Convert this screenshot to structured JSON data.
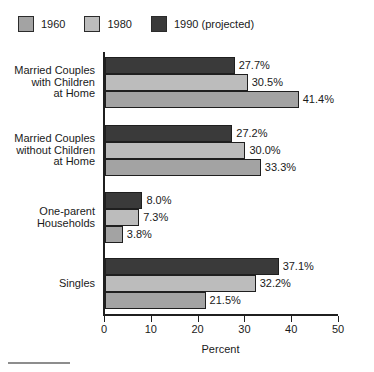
{
  "chart_data": {
    "type": "bar",
    "orientation": "horizontal",
    "title": "",
    "subtitle": "",
    "xlabel": "Percent",
    "ylabel": "",
    "xlim": [
      0,
      50
    ],
    "xticks": [
      0,
      10,
      20,
      30,
      40,
      50
    ],
    "xtick_labels": [
      "0",
      "10",
      "20",
      "30",
      "40",
      "50"
    ],
    "grid": false,
    "legend_position": "top-left",
    "value_label_suffix": "%",
    "categories": [
      "Married Couples\nwith Children\nat Home",
      "Married Couples\nwithout Children\nat Home",
      "One-parent\nHouseholds",
      "Singles"
    ],
    "series": [
      {
        "name": "1960",
        "color": "#a3a3a3",
        "values": [
          41.4,
          33.3,
          3.8,
          21.5
        ],
        "value_labels": [
          "41.4%",
          "33.3%",
          "3.8%",
          "21.5%"
        ]
      },
      {
        "name": "1980",
        "color": "#bcbcbc",
        "values": [
          30.5,
          30.0,
          7.3,
          32.2
        ],
        "value_labels": [
          "30.5%",
          "30.0%",
          "7.3%",
          "32.2%"
        ]
      },
      {
        "name": "1990 (projected)",
        "color": "#3a3a3a",
        "values": [
          27.7,
          27.2,
          8.0,
          37.1
        ],
        "value_labels": [
          "27.7%",
          "27.2%",
          "8.0%",
          "37.1%"
        ]
      }
    ]
  },
  "legend": {
    "entries": [
      {
        "label": "1960",
        "color": "#a3a3a3"
      },
      {
        "label": "1980",
        "color": "#bcbcbc"
      },
      {
        "label": "1990 (projected)",
        "color": "#3a3a3a"
      }
    ]
  },
  "axis": {
    "x_title": "Percent",
    "ticks": [
      "0",
      "10",
      "20",
      "30",
      "40",
      "50"
    ]
  },
  "categories": [
    {
      "label": "Married Couples\nwith Children\nat Home"
    },
    {
      "label": "Married Couples\nwithout Children\nat Home"
    },
    {
      "label": "One-parent\nHouseholds"
    },
    {
      "label": "Singles"
    }
  ],
  "bars": [
    {
      "category": 0,
      "series": "1990 (projected)",
      "value": 27.7,
      "label": "27.7%",
      "color": "#3a3a3a"
    },
    {
      "category": 0,
      "series": "1980",
      "value": 30.5,
      "label": "30.5%",
      "color": "#bcbcbc"
    },
    {
      "category": 0,
      "series": "1960",
      "value": 41.4,
      "label": "41.4%",
      "color": "#a3a3a3"
    },
    {
      "category": 1,
      "series": "1990 (projected)",
      "value": 27.2,
      "label": "27.2%",
      "color": "#3a3a3a"
    },
    {
      "category": 1,
      "series": "1980",
      "value": 30.0,
      "label": "30.0%",
      "color": "#bcbcbc"
    },
    {
      "category": 1,
      "series": "1960",
      "value": 33.3,
      "label": "33.3%",
      "color": "#a3a3a3"
    },
    {
      "category": 2,
      "series": "1990 (projected)",
      "value": 8.0,
      "label": "8.0%",
      "color": "#3a3a3a"
    },
    {
      "category": 2,
      "series": "1980",
      "value": 7.3,
      "label": "7.3%",
      "color": "#bcbcbc"
    },
    {
      "category": 2,
      "series": "1960",
      "value": 3.8,
      "label": "3.8%",
      "color": "#a3a3a3"
    },
    {
      "category": 3,
      "series": "1990 (projected)",
      "value": 37.1,
      "label": "37.1%",
      "color": "#3a3a3a"
    },
    {
      "category": 3,
      "series": "1980",
      "value": 32.2,
      "label": "32.2%",
      "color": "#bcbcbc"
    },
    {
      "category": 3,
      "series": "1960",
      "value": 21.5,
      "label": "21.5%",
      "color": "#a3a3a3"
    }
  ]
}
